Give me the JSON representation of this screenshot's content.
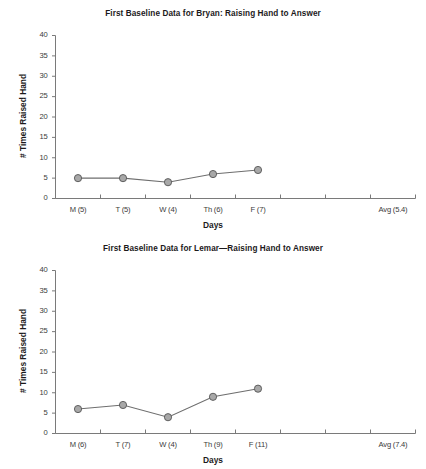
{
  "document": {
    "kind": "two-panel-line-graph-figure"
  },
  "charts": [
    {
      "id": "bryan",
      "title": "First Baseline Data for Bryan: Raising Hand to Answer",
      "xlabel": "Days",
      "ylabel": "# Times Raised Hand",
      "yticks": [
        "0",
        "5",
        "10",
        "15",
        "20",
        "25",
        "30",
        "35",
        "40"
      ],
      "xticks": [
        "M (5)",
        "T (5)",
        "W (4)",
        "Th (6)",
        "F (7)",
        "",
        "",
        "Avg (5.4)"
      ],
      "chart_data": {
        "type": "line",
        "title": "First Baseline Data for Bryan: Raising Hand to Answer",
        "xlabel": "Days",
        "ylabel": "# Times Raised Hand",
        "categories": [
          "M (5)",
          "T (5)",
          "W (4)",
          "Th (6)",
          "F (7)",
          "",
          "",
          "Avg (5.4)"
        ],
        "x": [
          0,
          1,
          2,
          3,
          4
        ],
        "values": [
          5,
          5,
          4,
          6,
          7
        ],
        "average": 5.4,
        "ylim": [
          0,
          40
        ],
        "ytick_step": 5,
        "grid": false,
        "legend": "none",
        "marker": "circle",
        "marker_fill": "#a8a8a8",
        "marker_edge": "#555555",
        "line_color": "#6e6e6e"
      }
    },
    {
      "id": "lemar",
      "title": "First Baseline Data for Lemar—Raising Hand to Answer",
      "xlabel": "Days",
      "ylabel": "# Times Raised Hand",
      "yticks": [
        "0",
        "5",
        "10",
        "15",
        "20",
        "25",
        "30",
        "35",
        "40"
      ],
      "xticks": [
        "M (6)",
        "T (7)",
        "W (4)",
        "Th (9)",
        "F (11)",
        "",
        "",
        "Avg (7.4)"
      ],
      "chart_data": {
        "type": "line",
        "title": "First Baseline Data for Lemar—Raising Hand to Answer",
        "xlabel": "Days",
        "ylabel": "# Times Raised Hand",
        "categories": [
          "M (6)",
          "T (7)",
          "W (4)",
          "Th (9)",
          "F (11)",
          "",
          "",
          "Avg (7.4)"
        ],
        "x": [
          0,
          1,
          2,
          3,
          4
        ],
        "values": [
          6,
          7,
          4,
          9,
          11
        ],
        "average": 7.4,
        "ylim": [
          0,
          40
        ],
        "ytick_step": 5,
        "grid": false,
        "legend": "none",
        "marker": "circle",
        "marker_fill": "#a8a8a8",
        "marker_edge": "#555555",
        "line_color": "#6e6e6e"
      }
    }
  ],
  "colors": {
    "axis": "#7a7a7a",
    "text": "#231f20",
    "marker_fill": "#a8a8a8",
    "marker_edge": "#555555",
    "line": "#6e6e6e",
    "background": "#ffffff"
  }
}
